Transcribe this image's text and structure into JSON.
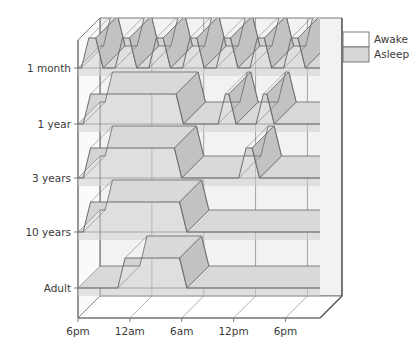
{
  "chart_data": {
    "type": "area",
    "title": "",
    "subtitle": "",
    "xlabel": "",
    "ylabel": "",
    "style": "3d-ribbon",
    "grid": true,
    "legend_position": "top-right",
    "x_tick_labels": [
      "6pm",
      "12am",
      "6am",
      "12pm",
      "6pm"
    ],
    "x_tick_hours": [
      0,
      6,
      12,
      18,
      24
    ],
    "x_range_hours": [
      0,
      28
    ],
    "categories": [
      "1 month",
      "1 year",
      "3 years",
      "10 years",
      "Adult"
    ],
    "legend": [
      {
        "label": "Awake",
        "color": "#ffffff"
      },
      {
        "label": "Asleep",
        "color": "#d8d8d8"
      }
    ],
    "series": [
      {
        "name": "1 month",
        "state_high": "Asleep",
        "state_low": "Awake",
        "description": "Polyphasic: many short sleep-wake cycles spread evenly through day and night",
        "intervals_asleep": [
          [
            0.4,
            2.9
          ],
          [
            4.3,
            6.8
          ],
          [
            8.2,
            10.7
          ],
          [
            12.1,
            14.6
          ],
          [
            16.0,
            18.5
          ],
          [
            19.9,
            22.4
          ],
          [
            23.8,
            26.3
          ]
        ]
      },
      {
        "name": "1 year",
        "state_high": "Asleep",
        "state_low": "Awake",
        "description": "Long night sleep plus two daytime naps",
        "intervals_asleep": [
          [
            0.6,
            12.2
          ],
          [
            16.2,
            18.3
          ],
          [
            20.6,
            22.7
          ]
        ]
      },
      {
        "name": "3 years",
        "state_high": "Asleep",
        "state_low": "Awake",
        "description": "Long night sleep plus a single afternoon nap",
        "intervals_asleep": [
          [
            0.6,
            12.0
          ],
          [
            18.6,
            21.0
          ]
        ]
      },
      {
        "name": "10 years",
        "state_high": "Asleep",
        "state_low": "Awake",
        "description": "Single consolidated night sleep, no naps",
        "intervals_asleep": [
          [
            0.6,
            12.6
          ]
        ]
      },
      {
        "name": "Adult",
        "state_high": "Asleep",
        "state_low": "Awake",
        "description": "Single consolidated night sleep beginning later at night",
        "intervals_asleep": [
          [
            4.6,
            12.6
          ]
        ]
      }
    ]
  },
  "colors": {
    "asleep_top": "#d9d9d9",
    "asleep_side": "#c2c2c2",
    "asleep_front": "#cfcfcf",
    "awake_top": "#ffffff",
    "awake_side": "#efefef",
    "panel": "#f2f2f2",
    "grid_line": "#8d8d8d",
    "ribbon_stroke": "#6e6e6e",
    "box_line": "#6e6e6e",
    "text": "#3a3a3a"
  }
}
